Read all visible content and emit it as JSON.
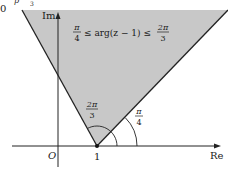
{
  "diagram": {
    "title_fragment_top": "0",
    "title_fragment_p": "p",
    "title_fragment_3": "3",
    "axes": {
      "x_label": "Re",
      "y_label": "Im",
      "origin_label": "O",
      "point_label": "1"
    },
    "region": {
      "inequality": {
        "left_num": "π",
        "left_den": "4",
        "middle": "≤ arg(z − 1) ≤",
        "right_num": "2π",
        "right_den": "3"
      },
      "fill_color": "#c8c8c8"
    },
    "angles": [
      {
        "num": "2π",
        "den": "3"
      },
      {
        "num": "π",
        "den": "4"
      }
    ]
  }
}
